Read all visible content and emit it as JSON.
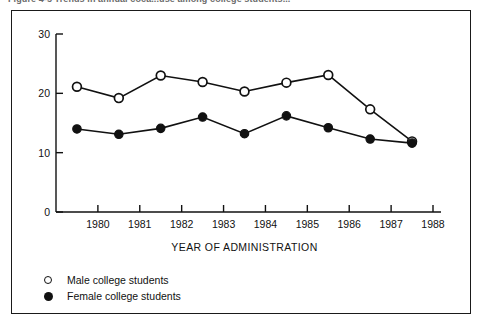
{
  "figure": {
    "caption": "Figure 4-5   Trends in annual coca...use among college students..."
  },
  "chart_data": {
    "type": "line",
    "title": "",
    "xlabel": "YEAR OF ADMINISTRATION",
    "ylabel": "",
    "x": [
      1979.5,
      1980.5,
      1981.5,
      1982.5,
      1983.5,
      1984.5,
      1985.5,
      1986.5,
      1987.5
    ],
    "xticks": [
      1980,
      1981,
      1982,
      1983,
      1984,
      1985,
      1986,
      1987,
      1988
    ],
    "xtick_labels": [
      "1980",
      "1981",
      "1982",
      "1983",
      "1984",
      "1985",
      "1986",
      "1987",
      "1988"
    ],
    "yticks": [
      0,
      10,
      20,
      30
    ],
    "ytick_labels": [
      "0",
      "10",
      "20",
      "30"
    ],
    "xlim": [
      1979,
      1988
    ],
    "ylim": [
      0,
      30
    ],
    "grid": false,
    "legend_position": "below-plot",
    "series": [
      {
        "name": "Male college students",
        "marker": "open-circle",
        "values": [
          21.1,
          19.2,
          23.0,
          21.9,
          20.3,
          21.8,
          23.1,
          17.3,
          11.9
        ]
      },
      {
        "name": "Female college students",
        "marker": "filled-circle",
        "values": [
          14.0,
          13.1,
          14.1,
          16.0,
          13.2,
          16.2,
          14.2,
          12.3,
          11.6
        ]
      }
    ]
  },
  "legend": {
    "items": [
      {
        "label": "Male college students",
        "marker": "open-circle"
      },
      {
        "label": "Female college students",
        "marker": "filled-circle"
      }
    ]
  },
  "colors": {
    "line": "#111111",
    "frame": "#1a1a1a",
    "background": "#ffffff"
  }
}
